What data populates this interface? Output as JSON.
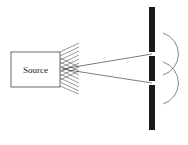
{
  "diagram": {
    "source": {
      "label": "Source"
    },
    "elements": [
      "source-box",
      "light-rays",
      "barrier-with-two-slits",
      "diffracted-wavefronts"
    ],
    "colors": {
      "stroke": "#333333",
      "barrier": "#1a1a1a",
      "background": "#ffffff"
    }
  }
}
